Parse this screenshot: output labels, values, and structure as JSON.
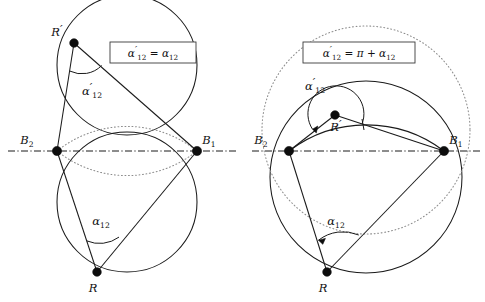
{
  "figure": {
    "title": "",
    "panels": [
      {
        "id": "left",
        "formula_box": "α'₁₂ = α₁₂",
        "formula_parts": {
          "lhs_base": "α",
          "lhs_prime": "′",
          "lhs_sub": "12",
          "equals": "=",
          "rhs_base": "α",
          "rhs_sub": "12",
          "pi": "",
          "plus": ""
        },
        "points": [
          {
            "name": "R-prime",
            "label_base": "R",
            "label_prime": "′",
            "label_sub": "",
            "x": 74,
            "y": 43,
            "label_x": 57,
            "label_y": 36
          },
          {
            "name": "B2",
            "label_base": "B",
            "label_prime": "",
            "label_sub": "2",
            "x": 57,
            "y": 151,
            "label_x": 27,
            "label_y": 144
          },
          {
            "name": "B1",
            "label_base": "B",
            "label_prime": "",
            "label_sub": "1",
            "x": 197,
            "y": 151,
            "label_x": 207,
            "label_y": 144
          },
          {
            "name": "R",
            "label_base": "R",
            "label_prime": "",
            "label_sub": "",
            "x": 97,
            "y": 272,
            "label_x": 93,
            "label_y": 291
          }
        ],
        "angle_labels": [
          {
            "name": "alpha-prime-12",
            "base": "α",
            "prime": "′",
            "sub": "12",
            "x": 92,
            "y": 92
          },
          {
            "name": "alpha-12",
            "base": "α",
            "prime": "",
            "sub": "12",
            "x": 101,
            "y": 224
          }
        ]
      },
      {
        "id": "right",
        "formula_box": "α'₁₂ = π + α₁₂",
        "formula_parts": {
          "lhs_base": "α",
          "lhs_prime": "′",
          "lhs_sub": "12",
          "equals": "=",
          "rhs_base": "α",
          "rhs_sub": "12",
          "pi": "π",
          "plus": "+"
        },
        "points": [
          {
            "name": "R-prime",
            "label_base": "R",
            "label_prime": "′",
            "label_sub": "",
            "x": 335,
            "y": 115,
            "label_x": 333,
            "label_y": 131
          },
          {
            "name": "B2",
            "label_base": "B",
            "label_prime": "",
            "label_sub": "2",
            "x": 289,
            "y": 151,
            "label_x": 260,
            "label_y": 144
          },
          {
            "name": "B1",
            "label_base": "B",
            "label_prime": "",
            "label_sub": "1",
            "x": 444,
            "y": 151,
            "label_x": 452,
            "label_y": 144
          },
          {
            "name": "R",
            "label_base": "R",
            "label_prime": "",
            "label_sub": "",
            "x": 327,
            "y": 272,
            "label_x": 323,
            "label_y": 291
          }
        ],
        "angle_labels": [
          {
            "name": "alpha-prime-12",
            "base": "α",
            "prime": "′",
            "sub": "12",
            "x": 315,
            "y": 87
          },
          {
            "name": "alpha-12",
            "base": "α",
            "prime": "",
            "sub": "12",
            "x": 336,
            "y": 224
          }
        ]
      }
    ],
    "colors": {
      "stroke": "#1a1a1a",
      "dotted": "#8c8c8c",
      "point": "#0d0d0d",
      "background": "#ffffff"
    },
    "axis_label": "symmetry-axis"
  }
}
